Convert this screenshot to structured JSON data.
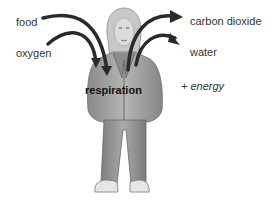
{
  "diagram": {
    "inputs": [
      {
        "label": "food"
      },
      {
        "label": "oxygen"
      }
    ],
    "process": {
      "label": "respiration"
    },
    "outputs": [
      {
        "label": "carbon dioxide"
      },
      {
        "label": "water"
      }
    ],
    "byproduct": {
      "label": "+ energy"
    },
    "colors": {
      "arrow": "#2a2a2a",
      "figure_gray": "#9a9a9a",
      "text": "#333333"
    }
  }
}
